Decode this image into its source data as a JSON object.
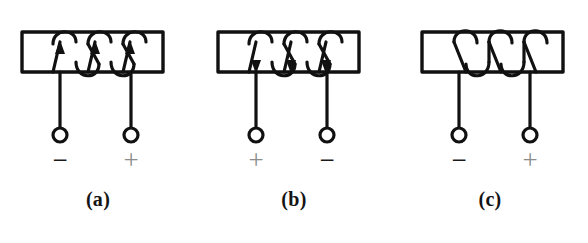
{
  "figure": {
    "background_color": "#ffffff",
    "ink_color": "#111111",
    "gray_sign_color": "#8c8c8c",
    "black_sign_color": "#1a1a1a",
    "panel_count": 3
  },
  "panels": [
    {
      "id": "a",
      "caption": "(a)",
      "coil_turns": 3,
      "winding_slant": "up-right",
      "current_arrows": "up",
      "arrow_count": 3,
      "left_terminal_sign": "−",
      "right_terminal_sign": "+",
      "left_sign_color": "#1a1a1a",
      "right_sign_color": "#8c8c8c",
      "core_box": {
        "x": 22,
        "y": 32,
        "width": 141,
        "height": 40
      },
      "left_lead_x": 60,
      "right_lead_x": 131,
      "terminal_y": 135,
      "terminal_radius": 7
    },
    {
      "id": "b",
      "caption": "(b)",
      "coil_turns": 3,
      "winding_slant": "up-right",
      "current_arrows": "down",
      "arrow_count": 3,
      "left_terminal_sign": "+",
      "right_terminal_sign": "−",
      "left_sign_color": "#8c8c8c",
      "right_sign_color": "#1a1a1a",
      "core_box": {
        "x": 22,
        "y": 32,
        "width": 141,
        "height": 40
      },
      "left_lead_x": 60,
      "right_lead_x": 131,
      "terminal_y": 135,
      "terminal_radius": 7
    },
    {
      "id": "c",
      "caption": "(c)",
      "coil_turns": 3,
      "winding_slant": "down-right",
      "current_arrows": "none",
      "arrow_count": 0,
      "left_terminal_sign": "−",
      "right_terminal_sign": "+",
      "left_sign_color": "#1a1a1a",
      "right_sign_color": "#8c8c8c",
      "core_box": {
        "x": 30,
        "y": 32,
        "width": 141,
        "height": 40
      },
      "left_lead_x": 67,
      "right_lead_x": 138,
      "terminal_y": 135,
      "terminal_radius": 7
    }
  ]
}
